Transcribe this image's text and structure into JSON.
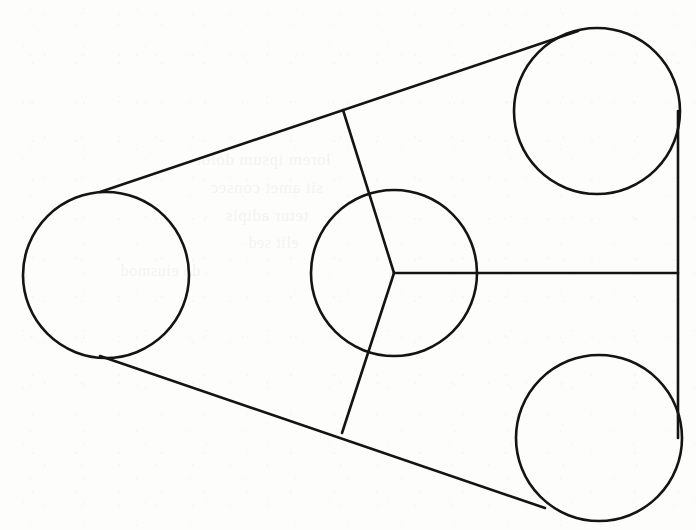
{
  "figure": {
    "type": "line-drawing",
    "background_color": "#fdfdfc",
    "stroke_color": "#141414",
    "canvas": {
      "width": 696,
      "height": 530
    },
    "ghost_text": {
      "note": "faint show-through from the reverse of the scanned page (illegible)",
      "lines": [
        "lorem ipsum dolor",
        "sit amet consec",
        "tetur adipis",
        "elit sed",
        "do eiusmod"
      ]
    },
    "circles": [
      {
        "name": "left-pulley",
        "cx": 106,
        "cy": 275,
        "r": 83
      },
      {
        "name": "top-right-pulley",
        "cx": 597,
        "cy": 111,
        "r": 83
      },
      {
        "name": "bottom-right-pulley",
        "cx": 599,
        "cy": 438,
        "r": 83
      },
      {
        "name": "center-hub-pulley",
        "cx": 394,
        "cy": 273,
        "r": 83
      }
    ],
    "lines": [
      {
        "name": "upper-belt-tangent",
        "x1": 100,
        "y1": 192,
        "x2": 578,
        "y2": 31
      },
      {
        "name": "lower-belt-tangent",
        "x1": 100,
        "y1": 356,
        "x2": 545,
        "y2": 508
      },
      {
        "name": "right-belt-vertical",
        "x1": 678,
        "y1": 111,
        "x2": 678,
        "y2": 438
      },
      {
        "name": "hub-spoke-upper",
        "x1": 394,
        "y1": 273,
        "x2": 343,
        "y2": 110
      },
      {
        "name": "hub-spoke-lower",
        "x1": 394,
        "y1": 273,
        "x2": 342,
        "y2": 433
      },
      {
        "name": "hub-spoke-right",
        "x1": 394,
        "y1": 273,
        "x2": 678,
        "y2": 273
      }
    ],
    "stroke_widths": {
      "circle": 2.6,
      "belt": 2.6,
      "spoke": 2.6
    }
  },
  "chart_data": {
    "type": "scatter",
    "xlabel": "",
    "ylabel": "",
    "xlim": [
      0,
      696
    ],
    "ylim": [
      530,
      0
    ],
    "grid": false,
    "legend": "none",
    "series": [
      {
        "name": "pulley-centers",
        "x": [
          106,
          597,
          599,
          394
        ],
        "y": [
          275,
          111,
          438,
          273
        ],
        "labels": [
          "left-pulley",
          "top-right-pulley",
          "bottom-right-pulley",
          "center-hub-pulley"
        ],
        "radii": [
          83,
          83,
          83,
          83
        ]
      }
    ],
    "annotations": [
      "upper belt tangent from left pulley (100,192) to top-right pulley (578,31)",
      "lower belt tangent from left pulley (100,356) to bottom-right pulley (545,508)",
      "vertical belt span at x=678 from y=111 to y=438",
      "three hub spokes radiate from (394,273) at roughly 0 deg, 107 deg and -108 deg"
    ]
  }
}
